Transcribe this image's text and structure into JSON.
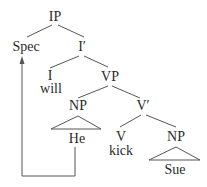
{
  "diagram": {
    "type": "syntax-tree",
    "colors": {
      "line": "#555555",
      "text": "#2a2a2a",
      "background": "#ffffff"
    },
    "nodes": {
      "ip": "IP",
      "spec": "Spec",
      "ibar": "I′",
      "i": "I",
      "will": "will",
      "vp": "VP",
      "np_subj": "NP",
      "he": "He",
      "vbar": "V′",
      "v": "V",
      "kick": "kick",
      "np_obj": "NP",
      "sue": "Sue"
    },
    "movement_arrow": {
      "from": "He",
      "to": "Spec"
    }
  }
}
